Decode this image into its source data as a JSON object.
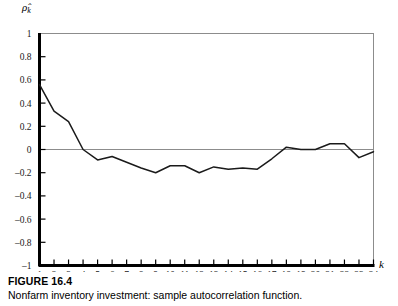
{
  "figure": {
    "number_label": "FIGURE 16.4",
    "caption": "Nonfarm inventory investment: sample autocorrelation function."
  },
  "chart_data": {
    "type": "line",
    "title": "",
    "xlabel": "k",
    "ylabel": "ρ̂k",
    "ylabel_base": "ρ̂",
    "ylabel_sub": "k",
    "xlim": [
      1,
      24
    ],
    "ylim": [
      -1,
      1
    ],
    "grid": false,
    "legend": "none",
    "zero_line": true,
    "x": [
      1,
      2,
      3,
      4,
      5,
      6,
      7,
      8,
      9,
      10,
      11,
      12,
      13,
      14,
      15,
      16,
      17,
      18,
      19,
      20,
      21,
      22,
      23,
      24
    ],
    "values": [
      0.56,
      0.33,
      0.24,
      0.0,
      -0.09,
      -0.06,
      -0.11,
      -0.16,
      -0.2,
      -0.14,
      -0.14,
      -0.2,
      -0.15,
      -0.17,
      -0.16,
      -0.17,
      -0.08,
      0.02,
      0.0,
      0.0,
      0.05,
      0.05,
      -0.07,
      -0.02
    ],
    "ytick_values": [
      1,
      0.8,
      0.6,
      0.4,
      0.2,
      0,
      -0.2,
      -0.4,
      -0.6,
      -0.8,
      -1
    ],
    "ytick_labels": [
      "1",
      "0.8",
      "0.6",
      "0.4",
      "0.2",
      "0",
      "–0.2",
      "–0.4",
      "–0.6",
      "–0.8",
      "–1"
    ],
    "xtick_values": [
      1,
      2,
      3,
      4,
      5,
      6,
      7,
      8,
      9,
      10,
      11,
      12,
      13,
      14,
      15,
      16,
      17,
      18,
      19,
      20,
      21,
      22,
      23,
      24
    ],
    "xtick_labels": [
      "1",
      "2",
      "3",
      "4",
      "5",
      "6",
      "7",
      "8",
      "9",
      "10",
      "11",
      "12",
      "13",
      "14",
      "15",
      "16",
      "17",
      "18",
      "19",
      "20",
      "21",
      "22",
      "23",
      "24"
    ],
    "colors": {
      "line": "#1a1a1a",
      "axis": "#000000",
      "frame": "#8c8c8c",
      "zero_line": "#8c8c8c",
      "background": "#ffffff"
    }
  }
}
